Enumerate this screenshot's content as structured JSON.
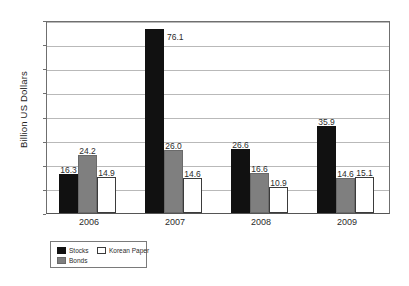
{
  "chart_data": {
    "type": "bar",
    "title": "",
    "subtitle": "",
    "xlabel": "",
    "ylabel": "Billion US Dollars",
    "categories": [
      "2006",
      "2007",
      "2008",
      "2009"
    ],
    "series": [
      {
        "name": "Stocks",
        "color": "#111111",
        "values": [
          16.3,
          76.1,
          26.6,
          35.9
        ]
      },
      {
        "name": "Bonds",
        "color": "#7f7f7f",
        "values": [
          24.2,
          26.0,
          16.6,
          14.6
        ]
      },
      {
        "name": "Korean Paper",
        "color": "#ffffff",
        "values": [
          14.9,
          14.6,
          10.9,
          15.1
        ]
      }
    ],
    "value_labels": [
      [
        "16.3",
        "24.2",
        "14.9"
      ],
      [
        "76.1",
        "26.0",
        "14.6"
      ],
      [
        "26.6",
        "16.6",
        "10.9"
      ],
      [
        "35.9",
        "14.6",
        "15.1"
      ]
    ],
    "ylim": [
      0,
      80
    ],
    "yticks": [
      0,
      10,
      20,
      30,
      40,
      50,
      60,
      70,
      80
    ],
    "ytick_labels": [
      "0",
      "10",
      "20",
      "30",
      "40",
      "50",
      "60",
      "70",
      "80"
    ],
    "grid": true,
    "grid_axis": "y",
    "legend_position": "bottom-left",
    "legend_entries": [
      "Stocks",
      "Bonds",
      "Korean Paper"
    ]
  }
}
